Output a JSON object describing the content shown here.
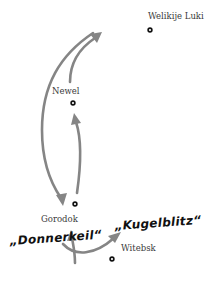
{
  "map": {
    "towns": [
      {
        "name": "Welikije Luki",
        "label_x": 148,
        "label_y": 19,
        "dot_x": 150,
        "dot_y": 30
      },
      {
        "name": "Newel",
        "label_x": 52,
        "label_y": 94,
        "dot_x": 73,
        "dot_y": 103
      },
      {
        "name": "Gorodok",
        "label_x": 41,
        "label_y": 222,
        "dot_x": 75,
        "dot_y": 204
      },
      {
        "name": "Witebsk",
        "label_x": 121,
        "label_y": 251,
        "dot_x": 112,
        "dot_y": 259
      }
    ],
    "operations": [
      {
        "name": "„Donnerkeil“",
        "x": 10,
        "y": 245
      },
      {
        "name": "„Kugelblitz“",
        "x": 115,
        "y": 230
      }
    ],
    "colors": {
      "arrow": "#858585",
      "text": "#111111",
      "town_label": "#3a3a3a",
      "background": "#ffffff"
    }
  }
}
